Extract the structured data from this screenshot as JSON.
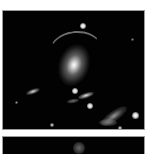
{
  "figure": {
    "panels": [
      {
        "id": "panel-1",
        "description": "Deep-field astronomical image of a galaxy cluster with central elliptical galaxy, gravitational arc, and surrounding galaxies/stars",
        "background": "#020202",
        "border": "#9a9a9a"
      },
      {
        "id": "panel-2",
        "description": "Second astronomical image panel (partially visible)",
        "background": "#020202",
        "border": "#9a9a9a"
      }
    ],
    "colors": {
      "page_background": "#ffffff",
      "sky": "#020202",
      "source_core": "#ffffff",
      "source_halo": "#bfbfbf"
    }
  }
}
